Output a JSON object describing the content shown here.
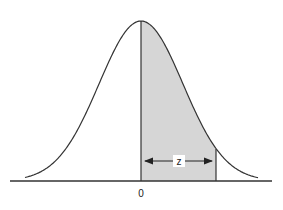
{
  "diagram": {
    "title": "",
    "type": "normal-distribution-curve",
    "axis_label_center": "0",
    "interval_label": "z",
    "colors": {
      "curve": "#333333",
      "shade": "#d6d6d6",
      "axis": "#333333"
    }
  },
  "chart_data": {
    "type": "area",
    "title": "",
    "xlabel": "",
    "ylabel": "",
    "tick_labels": [
      "0"
    ],
    "shaded_region": {
      "from": "0",
      "to": "z"
    },
    "annotations": [
      "z"
    ]
  }
}
